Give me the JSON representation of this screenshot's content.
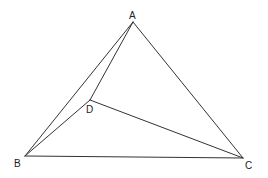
{
  "diagram": {
    "type": "geometry",
    "points": {
      "A": {
        "label": "A",
        "x": 133,
        "y": 22,
        "lx": 129,
        "ly": 19
      },
      "B": {
        "label": "B",
        "x": 25,
        "y": 156,
        "lx": 14,
        "ly": 167
      },
      "C": {
        "label": "C",
        "x": 243,
        "y": 158,
        "lx": 245,
        "ly": 169
      },
      "D": {
        "label": "D",
        "x": 90,
        "y": 100,
        "lx": 86,
        "ly": 113
      }
    },
    "edges": [
      [
        "A",
        "B"
      ],
      [
        "A",
        "C"
      ],
      [
        "B",
        "C"
      ],
      [
        "A",
        "D"
      ],
      [
        "B",
        "D"
      ],
      [
        "D",
        "C"
      ]
    ],
    "stroke_color": "#333333"
  }
}
